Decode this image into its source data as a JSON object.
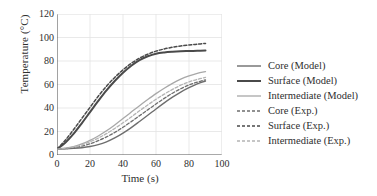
{
  "chart_data": {
    "type": "line",
    "title": "",
    "xlabel": "Time (s)",
    "ylabel": "Temperature (°C)",
    "xlim": [
      0,
      100
    ],
    "ylim": [
      0,
      120
    ],
    "xticks": [
      0,
      20,
      40,
      60,
      80,
      100
    ],
    "yticks": [
      0,
      20,
      40,
      60,
      80,
      100,
      120
    ],
    "grid": true,
    "legend_position": "right",
    "x": [
      0,
      5,
      10,
      15,
      20,
      25,
      30,
      35,
      40,
      45,
      50,
      55,
      60,
      65,
      70,
      75,
      80,
      85,
      90
    ],
    "series": [
      {
        "name": "Core (Model)",
        "style": "solid",
        "color": "#6e6e6e",
        "width": 1.4,
        "values": [
          5,
          5.2,
          5.6,
          6.2,
          7.2,
          8.8,
          11.2,
          14.5,
          18.6,
          23.3,
          28.5,
          33.8,
          39.2,
          44.4,
          49.2,
          53.6,
          57.3,
          60.5,
          63.0
        ]
      },
      {
        "name": "Surface (Model)",
        "style": "solid",
        "color": "#4a4a4a",
        "width": 2.0,
        "values": [
          5,
          10.5,
          18.0,
          27.0,
          36.5,
          46.0,
          55.0,
          63.0,
          70.0,
          76.0,
          80.8,
          84.0,
          86.2,
          87.3,
          87.9,
          88.3,
          88.5,
          88.7,
          88.9
        ]
      },
      {
        "name": "Intermediate (Model)",
        "style": "solid",
        "color": "#a8a8a8",
        "width": 1.3,
        "values": [
          5,
          5.8,
          7.2,
          9.4,
          12.4,
          16.2,
          20.6,
          25.6,
          31.0,
          36.5,
          42.0,
          47.2,
          52.2,
          56.8,
          61.0,
          64.5,
          67.3,
          69.5,
          71.0
        ]
      },
      {
        "name": "Core (Exp.)",
        "style": "dashed",
        "color": "#6e6e6e",
        "width": 1.3,
        "values": [
          5,
          5.4,
          6.2,
          7.6,
          9.6,
          12.2,
          15.4,
          19.2,
          23.6,
          28.4,
          33.4,
          38.4,
          43.4,
          48.2,
          52.6,
          56.4,
          59.6,
          62.0,
          64.0
        ]
      },
      {
        "name": "Surface (Exp.)",
        "style": "dashed",
        "color": "#4a4a4a",
        "width": 1.5,
        "values": [
          5,
          12.5,
          21.5,
          31.0,
          40.5,
          50.0,
          58.5,
          66.0,
          72.5,
          78.0,
          82.4,
          85.8,
          88.4,
          90.3,
          91.7,
          92.8,
          93.6,
          94.3,
          95.0
        ]
      },
      {
        "name": "Intermediate (Exp.)",
        "style": "dashed",
        "color": "#b4b4b4",
        "width": 1.3,
        "values": [
          5,
          5.6,
          6.8,
          8.6,
          11.2,
          14.4,
          18.2,
          22.6,
          27.4,
          32.4,
          37.6,
          42.6,
          47.4,
          51.8,
          55.8,
          59.4,
          62.2,
          64.4,
          66.0
        ]
      }
    ]
  },
  "legend": {
    "items": [
      {
        "label": "Core (Model)"
      },
      {
        "label": "Surface (Model)"
      },
      {
        "label": "Intermediate (Model)"
      },
      {
        "label": "Core (Exp.)"
      },
      {
        "label": "Surface (Exp.)"
      },
      {
        "label": "Intermediate (Exp.)"
      }
    ]
  },
  "axes": {
    "x_title": "Time (s)",
    "y_title": "Temperature (°C)",
    "x_tick_labels": [
      "0",
      "20",
      "40",
      "60",
      "80",
      "100"
    ],
    "y_tick_labels": [
      "0",
      "20",
      "40",
      "60",
      "80",
      "100",
      "120"
    ]
  },
  "colors": {
    "grid": "#e3e3e3",
    "axis": "#555555",
    "text": "#2e2e2e",
    "background": "#ffffff"
  }
}
